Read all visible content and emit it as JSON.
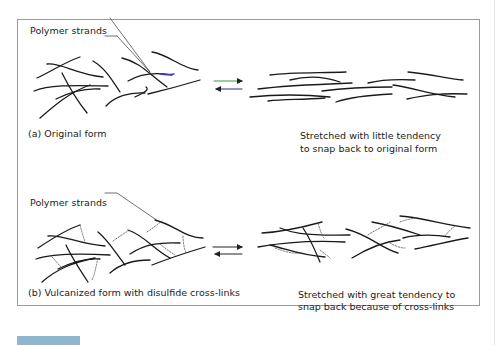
{
  "panel_a": {
    "pointer_label": "Polymer strands",
    "left_caption": "(a)  Original form",
    "right_caption_line1": "Stretched with little tendency",
    "right_caption_line2": "to snap back to original form",
    "arrow_forward_color": "#3a9a3a",
    "arrow_back_color": "#2a2a7a"
  },
  "panel_b": {
    "pointer_label": "Polymer strands",
    "left_caption": "(b)  Vulcanized form with disulfide cross-links",
    "right_caption_line1": "Stretched with great tendency to",
    "right_caption_line2": "snap back because of cross-links",
    "crosslink_label": "S–S"
  },
  "colors": {
    "strand": "#1a1a1a",
    "frame": "#9a9a9a",
    "accent_bar": "#8fb6cf"
  }
}
